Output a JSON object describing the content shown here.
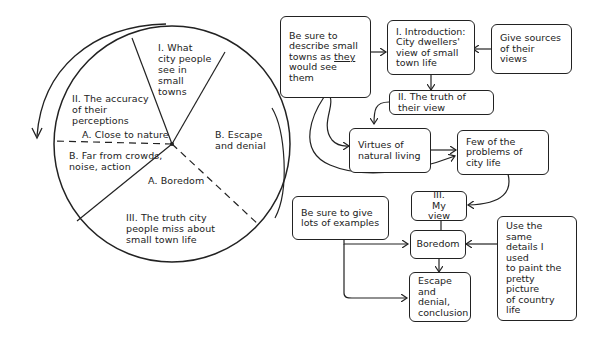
{
  "pie": {
    "title": "Essay outline as pie",
    "segments": [
      {
        "id": "I",
        "label": "I. What\ncity people\nsee in\nsmall\ntowns"
      },
      {
        "id": "II",
        "label": "II. The accuracy\nof their\nperceptions"
      },
      {
        "id": "IIA",
        "label": "A. Close to nature"
      },
      {
        "id": "IIB",
        "label": "B. Far from crowds,\nnoise, action"
      },
      {
        "id": "IIIA",
        "label": "A. Boredom"
      },
      {
        "id": "III",
        "label": "III. The truth city\npeople miss about\nsmall town life"
      },
      {
        "id": "IIIB",
        "label": "B. Escape\nand denial"
      }
    ]
  },
  "flow": {
    "nodes": [
      {
        "id": "describe",
        "pre": "Be sure to\ndescribe small\ntowns as ",
        "em": "they",
        "post": "\nwould see them"
      },
      {
        "id": "intro",
        "label": "I. Introduction:\nCity dwellers'\nview of small\ntown life"
      },
      {
        "id": "sources",
        "label": "Give sources\nof their views"
      },
      {
        "id": "truth",
        "label": "II. The truth of their view"
      },
      {
        "id": "virtues",
        "label": "Virtues of\nnatural living"
      },
      {
        "id": "problems",
        "label": "Few of the\nproblems of\ncity life"
      },
      {
        "id": "myview",
        "label": "III.\nMy view"
      },
      {
        "id": "examples",
        "label": "Be sure to give\nlots of examples"
      },
      {
        "id": "boredom",
        "label": "Boredom"
      },
      {
        "id": "same",
        "label": "Use the same\ndetails I used\nto paint the\npretty picture\nof country\nlife"
      },
      {
        "id": "escape",
        "label": "Escape\nand denial,\nconclusion"
      }
    ]
  }
}
